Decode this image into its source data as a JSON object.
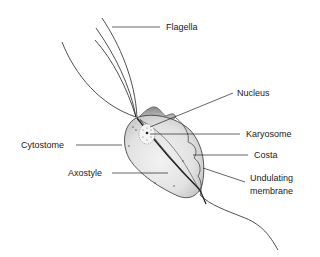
{
  "diagram": {
    "labels": {
      "flagella": "Flagella",
      "nucleus": "Nucleus",
      "karyosome": "Karyosome",
      "cytostome": "Cytostome",
      "costa": "Costa",
      "axostyle": "Axostyle",
      "undulating_membrane_line1": "Undulating",
      "undulating_membrane_line2": "membrane"
    },
    "colors": {
      "line": "#222222",
      "body_fill": "#e4e4e4",
      "body_shade": "#a8a8a8",
      "text": "#1a1a1a"
    }
  }
}
